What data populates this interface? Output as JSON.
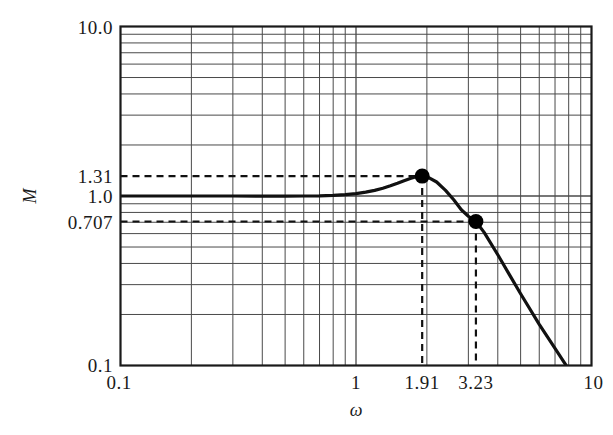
{
  "chart_data": {
    "type": "line",
    "title": "",
    "xlabel": "ω",
    "ylabel": "M",
    "xscale": "log",
    "yscale": "log",
    "xlim": [
      0.1,
      10
    ],
    "ylim": [
      0.1,
      10
    ],
    "grid": true,
    "legend": "none",
    "x_tick_labels": [
      "0.1",
      "1",
      "1.91",
      "3.23",
      "10"
    ],
    "x_tick_values": [
      0.1,
      1,
      1.91,
      3.23,
      10
    ],
    "y_tick_labels": [
      "10.0",
      "1.31",
      "1.0",
      "0.707",
      "0.1"
    ],
    "y_tick_values": [
      10.0,
      1.31,
      1.0,
      0.707,
      0.1
    ],
    "series": [
      {
        "name": "M",
        "x": [
          0.1,
          0.15,
          0.2,
          0.3,
          0.4,
          0.5,
          0.6,
          0.7,
          0.8,
          0.9,
          1.0,
          1.1,
          1.2,
          1.3,
          1.4,
          1.5,
          1.6,
          1.7,
          1.8,
          1.91,
          2.0,
          2.2,
          2.4,
          2.6,
          2.8,
          3.0,
          3.23,
          3.5,
          4.0,
          4.5,
          5.0,
          6.0,
          7.0,
          8.0,
          9.0,
          10.0
        ],
        "y": [
          1.0,
          1.0,
          1.0,
          1.0,
          0.999,
          0.999,
          1.0,
          1.002,
          1.008,
          1.018,
          1.033,
          1.054,
          1.08,
          1.112,
          1.15,
          1.19,
          1.232,
          1.27,
          1.3,
          1.31,
          1.3,
          1.21,
          1.08,
          0.95,
          0.83,
          0.76,
          0.707,
          0.61,
          0.45,
          0.34,
          0.265,
          0.175,
          0.126,
          0.095,
          0.074,
          0.06
        ]
      }
    ],
    "markers": [
      {
        "name": "resonant-peak",
        "x": 1.91,
        "y": 1.31,
        "label_x": "1.91",
        "label_y": "1.31"
      },
      {
        "name": "bandwidth-point",
        "x": 3.23,
        "y": 0.707,
        "label_x": "3.23",
        "label_y": "0.707"
      }
    ],
    "guide_lines": [
      {
        "name": "peak-horizontal-guide",
        "orientation": "horizontal",
        "value": 1.31,
        "style": "dashed"
      },
      {
        "name": "bandwidth-horizontal-guide",
        "orientation": "horizontal",
        "value": 0.707,
        "style": "dashed"
      },
      {
        "name": "peak-vertical-guide",
        "orientation": "vertical",
        "value": 1.91,
        "style": "dashed"
      },
      {
        "name": "bandwidth-vertical-guide",
        "orientation": "vertical",
        "value": 3.23,
        "style": "dashed"
      }
    ],
    "colors": {
      "curve": "#111111",
      "frame": "#1a1a1a",
      "grid": "#4a4a4a",
      "marker": "#000000",
      "background": "#ffffff"
    }
  }
}
